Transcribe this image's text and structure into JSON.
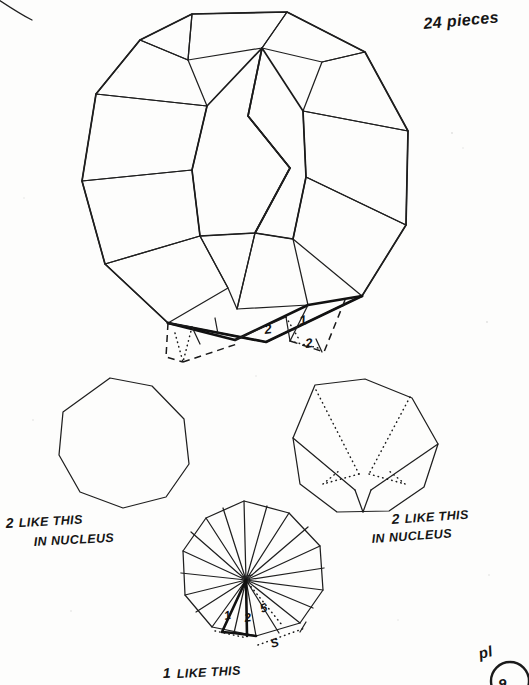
{
  "page": {
    "width": 529,
    "height": 685,
    "background_color": "#fdfdfc",
    "ink_color": "#1a1a1a",
    "medium": "hand-drawn ink on paper, scanned book page"
  },
  "annotations": {
    "title": "24 pieces",
    "folio_label": "pl",
    "folio_number": "9"
  },
  "figures": {
    "main": {
      "name": "truncated-octahedron-net-assembly",
      "description": "Hand drawn polyhedron in octagonal silhouette built from octagonal faces, square faces and triangular gores",
      "detail_numbers": [
        "2",
        "1",
        "2"
      ]
    },
    "lower_left": {
      "caption_count": "2",
      "caption_line1": "LIKE THIS",
      "caption_line2": "IN NUCLEUS",
      "shape": "plain-octagon"
    },
    "lower_right": {
      "caption_count": "2",
      "caption_line1": "LIKE THIS",
      "caption_line2": "IN NUCLEUS",
      "shape": "octagon-with-dotted-v-fold"
    },
    "bottom_center": {
      "caption_count": "1",
      "caption_line1": "LIKE THIS",
      "shape": "octagon-with-radial-fan",
      "labels": [
        "1",
        "2",
        "5",
        "S",
        "S"
      ]
    }
  }
}
